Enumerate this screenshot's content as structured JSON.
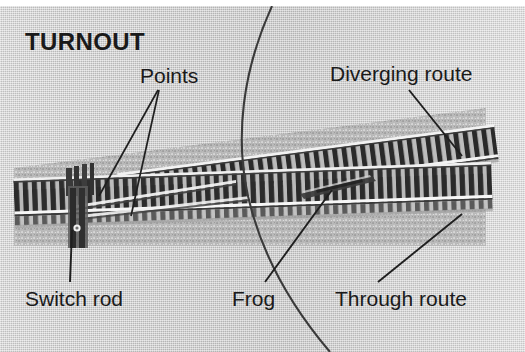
{
  "figure": {
    "title": "TURNOUT",
    "background_color": "#c6c6c6",
    "text_color": "#1a1a1a",
    "width": 525,
    "height": 352
  },
  "labels": {
    "title": "TURNOUT",
    "points": "Points",
    "diverging_route": "Diverging route",
    "switch_rod": "Switch rod",
    "frog": "Frog",
    "through_route": "Through route"
  },
  "annotations": [
    {
      "id": "points",
      "text": "Points",
      "x": 140,
      "y": 65,
      "leader_count": 2
    },
    {
      "id": "diverging-route",
      "text": "Diverging route",
      "x": 330,
      "y": 62,
      "leader_count": 1
    },
    {
      "id": "switch-rod",
      "text": "Switch rod",
      "x": 25,
      "y": 287,
      "leader_count": 1
    },
    {
      "id": "frog",
      "text": "Frog",
      "x": 232,
      "y": 287,
      "leader_count": 1
    },
    {
      "id": "through-route",
      "text": "Through route",
      "x": 335,
      "y": 287,
      "leader_count": 1
    }
  ],
  "track": {
    "routes": [
      "Diverging route",
      "Through route"
    ],
    "components": [
      "Points",
      "Switch rod",
      "Frog"
    ],
    "rail_color": "#efefef",
    "tie_color": "#2e2e2e"
  }
}
